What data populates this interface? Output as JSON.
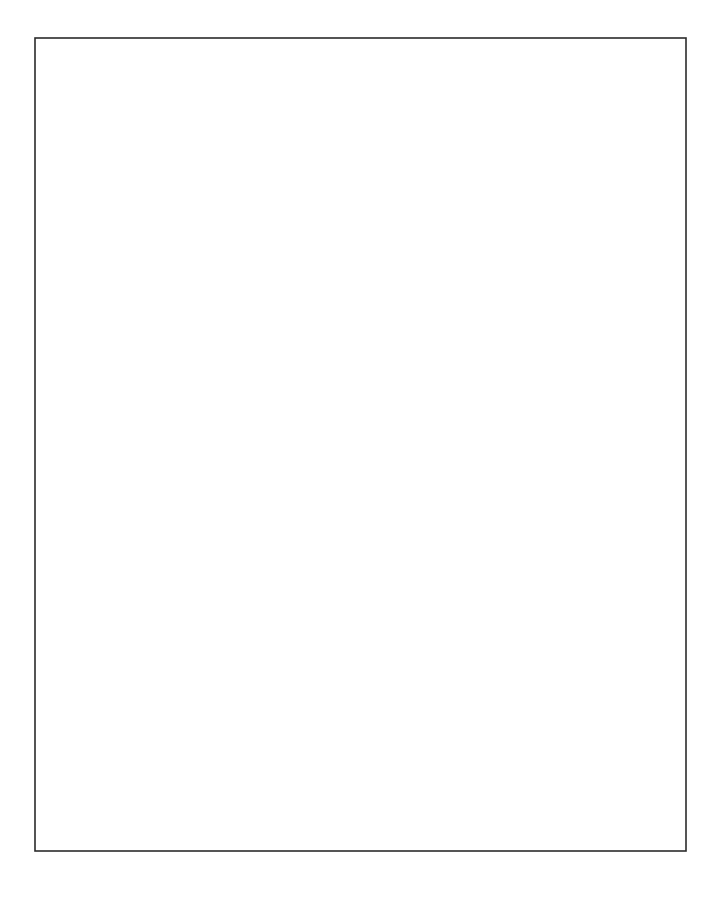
{
  "figure": {
    "type": "tiling-diagram",
    "canvas": {
      "width": 723,
      "height": 900,
      "background": "#ffffff"
    },
    "frame": {
      "x": 35,
      "y": 38,
      "width": 651,
      "height": 813,
      "stroke_color": "#2b2b2b",
      "stroke_width": 1.6
    },
    "lattice": {
      "orientation": "45-degree diagonal",
      "unit_pitch_px": 37.6,
      "unit_half_diagonal_px": 18.8,
      "columns": 17,
      "rows": 22,
      "origin_x": 35,
      "origin_y": 38,
      "tile_stroke_color": "#3a3a3a",
      "tile_stroke_width": 1.15,
      "fills": {
        "plain": "#ffffff",
        "stipple_dot": "#1a1a1a",
        "stipple_background": "#ffffff"
      },
      "tile_kinds": [
        "unit-diamond",
        "double-diamond"
      ]
    },
    "legend": {
      "plain_label": "plain patch",
      "stipple_label": "stippled patch",
      "double_label": "double-size patch"
    },
    "grid_codes": [
      "1021010221120102001",
      "0112102011021120110",
      "2101021102011021021",
      "1120110210112011210",
      "0211021021100210102",
      "1012210110221101021",
      "2100112021011020110",
      "0121021102110211202",
      "1210110210021120011",
      "0102211021102001210",
      "2011020112010211021",
      "1120101221102110102",
      "0211210110211021210",
      "1022011021020110021",
      "2101102102110212102",
      "0110210011021101021",
      "1021021120102210110",
      "2112102011210021201",
      "0210110210112110020",
      "1101221021021011211",
      "2011012110210211020",
      "0122101021102102101"
    ]
  }
}
